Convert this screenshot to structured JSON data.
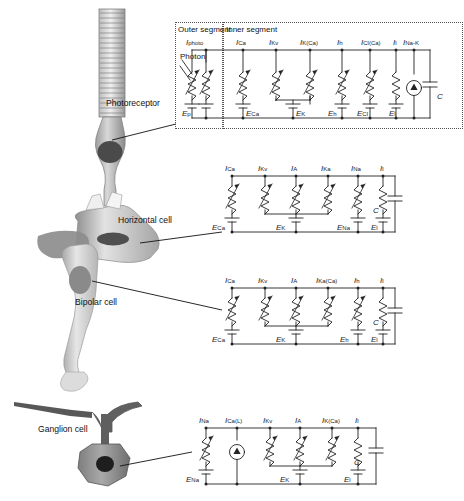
{
  "figure": {
    "background": "#ffffff",
    "ink": "#222222"
  },
  "cells": [
    {
      "id": "photoreceptor",
      "label": "Photoreceptor"
    },
    {
      "id": "horizontal",
      "label": "Horizontal cell"
    },
    {
      "id": "bipolar",
      "label": "Bipolar cell"
    },
    {
      "id": "ganglion",
      "label": "Ganglion cell"
    }
  ],
  "segments": {
    "outer": "Outer segment",
    "inner": "Inner segment",
    "photon": "Photon"
  },
  "capacitor_label": "C",
  "circuits": [
    {
      "id": "photoreceptor-circuit",
      "cell": "Photoreceptor",
      "boxed": true,
      "branches": [
        {
          "current": "I",
          "current_sub": "photo",
          "emf": "E",
          "emf_sub": "p",
          "type": "variable-resistor",
          "segment": "outer"
        },
        {
          "current": "I",
          "current_sub": "Ca",
          "emf": "E",
          "emf_sub": "Ca",
          "type": "variable-resistor",
          "segment": "inner"
        },
        {
          "current": "I",
          "current_sub": "Kv",
          "emf": "E",
          "emf_sub": "K",
          "type": "variable-resistor",
          "segment": "inner"
        },
        {
          "current": "I",
          "current_sub": "K(Ca)",
          "emf": "E",
          "emf_sub": "K",
          "type": "variable-resistor",
          "segment": "inner"
        },
        {
          "current": "I",
          "current_sub": "h",
          "emf": "E",
          "emf_sub": "h",
          "type": "variable-resistor",
          "segment": "inner"
        },
        {
          "current": "I",
          "current_sub": "Cl(Ca)",
          "emf": "E",
          "emf_sub": "Cl",
          "type": "variable-resistor",
          "segment": "inner"
        },
        {
          "current": "I",
          "current_sub": "l",
          "emf": "E",
          "emf_sub": "l",
          "type": "resistor",
          "segment": "inner"
        },
        {
          "current": "I",
          "current_sub": "Na-K",
          "emf": "",
          "emf_sub": "",
          "type": "current-source",
          "segment": "inner"
        },
        {
          "current": "",
          "current_sub": "",
          "emf": "",
          "emf_sub": "",
          "type": "capacitor",
          "segment": "inner"
        }
      ]
    },
    {
      "id": "horizontal-circuit",
      "cell": "Horizontal cell",
      "boxed": false,
      "branches": [
        {
          "current": "I",
          "current_sub": "Ca",
          "emf": "E",
          "emf_sub": "Ca",
          "type": "variable-resistor"
        },
        {
          "current": "I",
          "current_sub": "Kv",
          "emf": "E",
          "emf_sub": "K",
          "type": "variable-resistor"
        },
        {
          "current": "I",
          "current_sub": "A",
          "emf": "E",
          "emf_sub": "K",
          "type": "variable-resistor"
        },
        {
          "current": "I",
          "current_sub": "Ka",
          "emf": "E",
          "emf_sub": "K",
          "type": "variable-resistor"
        },
        {
          "current": "I",
          "current_sub": "Na",
          "emf": "E",
          "emf_sub": "Na",
          "type": "variable-resistor"
        },
        {
          "current": "I",
          "current_sub": "l",
          "emf": "E",
          "emf_sub": "l",
          "type": "resistor"
        },
        {
          "current": "",
          "current_sub": "",
          "emf": "",
          "emf_sub": "",
          "type": "capacitor"
        }
      ]
    },
    {
      "id": "bipolar-circuit",
      "cell": "Bipolar cell",
      "boxed": false,
      "branches": [
        {
          "current": "I",
          "current_sub": "Ca",
          "emf": "E",
          "emf_sub": "Ca",
          "type": "variable-resistor"
        },
        {
          "current": "I",
          "current_sub": "Kv",
          "emf": "E",
          "emf_sub": "K",
          "type": "variable-resistor"
        },
        {
          "current": "I",
          "current_sub": "A",
          "emf": "E",
          "emf_sub": "K",
          "type": "variable-resistor"
        },
        {
          "current": "I",
          "current_sub": "Ka(Ca)",
          "emf": "E",
          "emf_sub": "K",
          "type": "variable-resistor"
        },
        {
          "current": "I",
          "current_sub": "h",
          "emf": "E",
          "emf_sub": "h",
          "type": "variable-resistor"
        },
        {
          "current": "I",
          "current_sub": "l",
          "emf": "E",
          "emf_sub": "l",
          "type": "resistor"
        },
        {
          "current": "",
          "current_sub": "",
          "emf": "",
          "emf_sub": "",
          "type": "capacitor"
        }
      ]
    },
    {
      "id": "ganglion-circuit",
      "cell": "Ganglion cell",
      "boxed": false,
      "branches": [
        {
          "current": "I",
          "current_sub": "Na",
          "emf": "E",
          "emf_sub": "Na",
          "type": "variable-resistor"
        },
        {
          "current": "I",
          "current_sub": "Ca(L)",
          "emf": "",
          "emf_sub": "",
          "type": "current-source"
        },
        {
          "current": "I",
          "current_sub": "Kv",
          "emf": "E",
          "emf_sub": "K",
          "type": "variable-resistor"
        },
        {
          "current": "I",
          "current_sub": "A",
          "emf": "E",
          "emf_sub": "K",
          "type": "variable-resistor"
        },
        {
          "current": "I",
          "current_sub": "K(Ca)",
          "emf": "E",
          "emf_sub": "K",
          "type": "variable-resistor"
        },
        {
          "current": "I",
          "current_sub": "l",
          "emf": "E",
          "emf_sub": "l",
          "type": "resistor"
        },
        {
          "current": "",
          "current_sub": "",
          "emf": "",
          "emf_sub": "",
          "type": "capacitor"
        }
      ]
    }
  ]
}
